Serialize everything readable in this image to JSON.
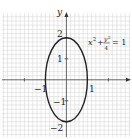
{
  "diagram": {
    "equation": {
      "x_term": "x",
      "x_exp": "2",
      "plus": "+",
      "y_num": "y",
      "y_exp": "2",
      "denominator": "4",
      "equals": "= 1"
    },
    "axes": {
      "x_label": "",
      "y_label": "y",
      "x_ticks": [
        "−1",
        "1"
      ],
      "y_ticks": [
        "2",
        "1",
        "−1",
        "−2"
      ]
    },
    "ellipse": {
      "a": 1,
      "b": 2,
      "center": [
        0,
        0
      ]
    },
    "colors": {
      "grid": "#d6d6d6",
      "axis": "#555555",
      "curve": "#222222"
    }
  }
}
